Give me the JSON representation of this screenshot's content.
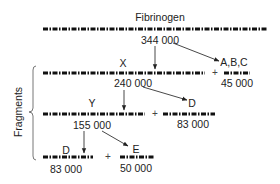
{
  "diagram": {
    "title": "Fibrinogen",
    "colors": {
      "chain": "#111111",
      "text": "#222222",
      "arrow": "#333333"
    },
    "bracket_label": "Fragments",
    "nodes": {
      "fibrinogen": {
        "label": "Fibrinogen",
        "mass": "344 000"
      },
      "x": {
        "label": "X",
        "mass": "240 000"
      },
      "abc": {
        "label": "A,B,C",
        "mass": "45 000"
      },
      "y": {
        "label": "Y",
        "mass": "155 000"
      },
      "d1": {
        "label": "D",
        "mass": "83 000"
      },
      "d2": {
        "label": "D",
        "mass": "83 000"
      },
      "e": {
        "label": "E",
        "mass": "50 000"
      }
    },
    "plus": "+",
    "edges": [
      {
        "from": "fibrinogen",
        "to": "x"
      },
      {
        "from": "fibrinogen",
        "to": "abc"
      },
      {
        "from": "x",
        "to": "y"
      },
      {
        "from": "x",
        "to": "d1"
      },
      {
        "from": "y",
        "to": "d2"
      },
      {
        "from": "y",
        "to": "e"
      }
    ]
  }
}
